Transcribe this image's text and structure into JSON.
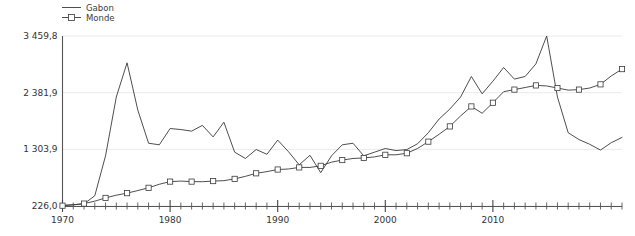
{
  "figure": {
    "width": 635,
    "height": 236,
    "background": "#ffffff",
    "line_color": "#3a3a3a",
    "grid_color": "#eaeaea",
    "axis_color": "#555555",
    "text_color": "#333333"
  },
  "legend": {
    "position": "top-left",
    "entries": [
      {
        "label": "Gabon",
        "marker": "none",
        "style": "line"
      },
      {
        "label": "Monde",
        "marker": "square",
        "style": "line-marker"
      }
    ]
  },
  "axes": {
    "y": {
      "ticks": [
        "226,0",
        "1 303,9",
        "2 381,9",
        "3 459,8"
      ],
      "tick_values": [
        226.0,
        1303.9,
        2381.9,
        3459.8
      ],
      "min": 226.0,
      "max": 3459.8,
      "label": ""
    },
    "x": {
      "ticks": [
        "1970",
        "1980",
        "1990",
        "2000",
        "2010"
      ],
      "tick_values": [
        1970,
        1980,
        1990,
        2000,
        2010
      ],
      "min": 1970,
      "max": 2022,
      "minor_tick_step": 1,
      "label": ""
    },
    "grid": "horizontal-only"
  },
  "chart_data": {
    "type": "line",
    "title": "",
    "subtitle": "",
    "xlabel": "",
    "ylabel": "",
    "xlim": [
      1970,
      2022
    ],
    "ylim": [
      226.0,
      3459.8
    ],
    "grid": true,
    "legend_position": "top-left",
    "x": [
      1970,
      1971,
      1972,
      1973,
      1974,
      1975,
      1976,
      1977,
      1978,
      1979,
      1980,
      1981,
      1982,
      1983,
      1984,
      1985,
      1986,
      1987,
      1988,
      1989,
      1990,
      1991,
      1992,
      1993,
      1994,
      1995,
      1996,
      1997,
      1998,
      1999,
      2000,
      2001,
      2002,
      2003,
      2004,
      2005,
      2006,
      2007,
      2008,
      2009,
      2010,
      2011,
      2012,
      2013,
      2014,
      2015,
      2016,
      2017,
      2018,
      2019,
      2020,
      2021,
      2022
    ],
    "series": [
      {
        "name": "Gabon",
        "marker": "none",
        "values": [
          240,
          250,
          268,
          420,
          1180,
          2300,
          2950,
          2050,
          1420,
          1390,
          1700,
          1680,
          1650,
          1760,
          1540,
          1820,
          1250,
          1130,
          1300,
          1210,
          1480,
          1260,
          1010,
          1190,
          860,
          1180,
          1390,
          1420,
          1180,
          1250,
          1320,
          1280,
          1300,
          1410,
          1620,
          1880,
          2070,
          2300,
          2690,
          2360,
          2600,
          2860,
          2640,
          2690,
          2930,
          3460,
          2300,
          1620,
          1490,
          1400,
          1290,
          1430,
          1530
        ]
      },
      {
        "name": "Monde",
        "marker": "square",
        "values": [
          232,
          248,
          272,
          318,
          380,
          432,
          470,
          520,
          572,
          640,
          690,
          700,
          690,
          688,
          700,
          708,
          742,
          790,
          848,
          880,
          920,
          930,
          960,
          960,
          990,
          1060,
          1100,
          1130,
          1140,
          1160,
          1200,
          1200,
          1230,
          1320,
          1450,
          1590,
          1740,
          1940,
          2120,
          1990,
          2190,
          2400,
          2440,
          2480,
          2520,
          2510,
          2470,
          2430,
          2440,
          2470,
          2540,
          2700,
          2830
        ]
      }
    ]
  }
}
